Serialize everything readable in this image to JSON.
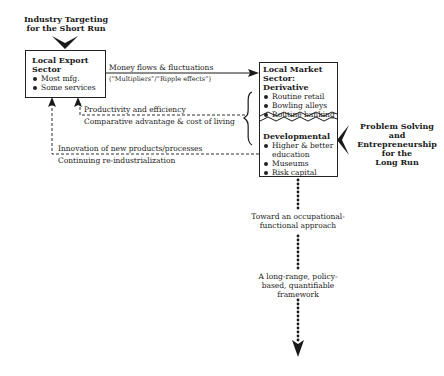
{
  "top_left_label": {
    "line1": "Industry Targeting",
    "line2": "for the Short Run"
  },
  "export_box": {
    "title_line1": "Local Export",
    "title_line2": "Sector",
    "items": [
      "Most mfg.",
      "Some services"
    ]
  },
  "market_box": {
    "derivative": {
      "title_line1": "Local Market",
      "title_line2": "Sector:",
      "title_line3": "Derivative",
      "items": [
        "Routine retail",
        "Bowling alleys",
        "Routine banking"
      ]
    },
    "developmental": {
      "title": "Developmental",
      "items": [
        "Higher & better education",
        "Museums",
        "Risk capital"
      ]
    }
  },
  "right_label": {
    "line1": "Problem Solving",
    "line2": "and",
    "line3": "Entrepreneurship",
    "line4": "for the",
    "line5": "Long Run"
  },
  "flows": {
    "money": {
      "line1": "Money flows & fluctuations",
      "line2": "(“Multipliers”/“Ripple effects”)"
    },
    "productivity": {
      "line1": "Productivity and efficiency",
      "line2": "Comparative advantage & cost of living"
    },
    "innovation": {
      "line1": "Innovation of new products/processes",
      "line2": "Continuing re-industrialization"
    }
  },
  "vertical_path": {
    "step1": {
      "line1": "Toward an occupational-",
      "line2": "functional approach"
    },
    "step2": {
      "line1": "A long-range, policy-",
      "line2": "based, quantifiable",
      "line3": "framework"
    }
  },
  "colors": {
    "ink": "#1a1a1a",
    "background": "#ffffff"
  }
}
